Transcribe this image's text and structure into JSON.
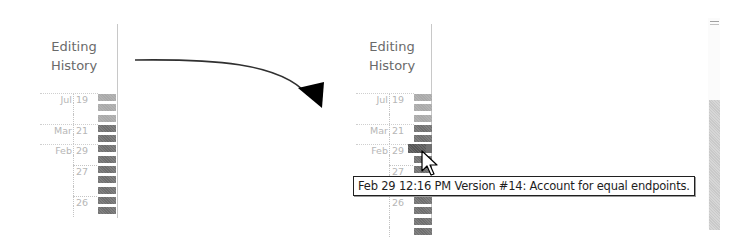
{
  "diagram": {
    "arrow": {
      "from": "left-panel",
      "to": "right-panel"
    }
  },
  "panels": {
    "left": {
      "title_line1": "Editing",
      "title_line2": "History",
      "rows": [
        {
          "month": "Jul",
          "day": "19",
          "shade": "light"
        },
        {
          "month": "",
          "day": "",
          "shade": "light"
        },
        {
          "month": "",
          "day": "",
          "shade": "light"
        },
        {
          "month": "Mar",
          "day": "21",
          "shade": "dark"
        },
        {
          "month": "",
          "day": "",
          "shade": "dark"
        },
        {
          "month": "Feb",
          "day": "29",
          "shade": "dark"
        },
        {
          "month": "",
          "day": "",
          "shade": "dark"
        },
        {
          "month": "",
          "day": "27",
          "shade": "dark"
        },
        {
          "month": "",
          "day": "",
          "shade": "dark"
        },
        {
          "month": "",
          "day": "",
          "shade": "dark"
        },
        {
          "month": "",
          "day": "26",
          "shade": "dark"
        },
        {
          "month": "",
          "day": "",
          "shade": "dark"
        }
      ]
    },
    "right": {
      "title_line1": "Editing",
      "title_line2": "History",
      "rows": [
        {
          "month": "Jul",
          "day": "19",
          "shade": "light"
        },
        {
          "month": "",
          "day": "",
          "shade": "light"
        },
        {
          "month": "",
          "day": "",
          "shade": "light"
        },
        {
          "month": "Mar",
          "day": "21",
          "shade": "dark"
        },
        {
          "month": "",
          "day": "",
          "shade": "dark"
        },
        {
          "month": "Feb",
          "day": "29",
          "shade": "hover"
        },
        {
          "month": "",
          "day": "",
          "shade": "dark"
        },
        {
          "month": "",
          "day": "27",
          "shade": "dark"
        },
        {
          "month": "",
          "day": "",
          "shade": "dark"
        },
        {
          "month": "",
          "day": "",
          "shade": "dark"
        },
        {
          "month": "",
          "day": "26",
          "shade": "dark"
        },
        {
          "month": "",
          "day": "",
          "shade": "dark"
        },
        {
          "month": "",
          "day": "",
          "shade": "dark"
        },
        {
          "month": "",
          "day": "",
          "shade": "dark"
        }
      ],
      "tooltip": "Feb 29 12:16 PM Version #14: Account for equal endpoints."
    }
  },
  "colors": {
    "bar_light": "#a9a9a9",
    "bar_dark": "#6f6f6f",
    "bar_hover": "#555555",
    "label_text": "#b6b6b6",
    "title_text": "#6a6a6a",
    "tooltip_border": "#202020"
  },
  "icons": {
    "arrow": "curved-arrow-icon",
    "cursor": "mouse-pointer-icon"
  }
}
